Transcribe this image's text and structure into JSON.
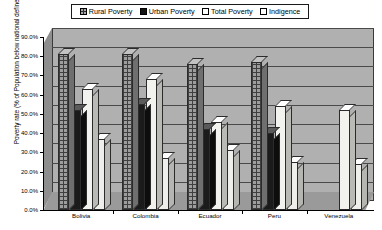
{
  "legend": {
    "items": [
      {
        "label": "Rural Poverty",
        "swatch": "rural-poverty-swatch-icon"
      },
      {
        "label": "Urban Poverty",
        "swatch": "urban-poverty-swatch-icon"
      },
      {
        "label": "Total Poverty",
        "swatch": "total-poverty-swatch-icon"
      },
      {
        "label": "Indigence",
        "swatch": "indigence-swatch-icon"
      }
    ]
  },
  "axis": {
    "y_title": "Poverty rate (% of Population below national defined level)",
    "y_ticks": [
      "90.0%",
      "80.0%",
      "70.0%",
      "60.0%",
      "50.0%",
      "40.0%",
      "30.0%",
      "20.0%",
      "10.0%",
      "0.0%"
    ]
  },
  "chart_data": {
    "type": "bar",
    "title": "",
    "xlabel": "",
    "ylabel": "Poverty rate (% of Population below national defined level)",
    "ylim": [
      0,
      90
    ],
    "ytick_values": [
      0,
      10,
      20,
      30,
      40,
      50,
      60,
      70,
      80,
      90
    ],
    "ytick_labels": [
      "0.0%",
      "10.0%",
      "20.0%",
      "30.0%",
      "40.0%",
      "50.0%",
      "60.0%",
      "70.0%",
      "80.0%",
      "90.0%"
    ],
    "grid": true,
    "legend_position": "top",
    "style": "3d-clustered-column",
    "categories": [
      "Bolivia",
      "Colombia",
      "Ecuador",
      "Peru",
      "Venezuela"
    ],
    "series": [
      {
        "name": "Rural Poverty",
        "values": [
          81,
          81,
          76,
          77,
          null
        ]
      },
      {
        "name": "Urban Poverty",
        "values": [
          52,
          55,
          42,
          40,
          null
        ]
      },
      {
        "name": "Total Poverty",
        "values": [
          63,
          68,
          46,
          54,
          52
        ]
      },
      {
        "name": "Indigence",
        "values": [
          37,
          27,
          31,
          25,
          24
        ]
      }
    ]
  }
}
